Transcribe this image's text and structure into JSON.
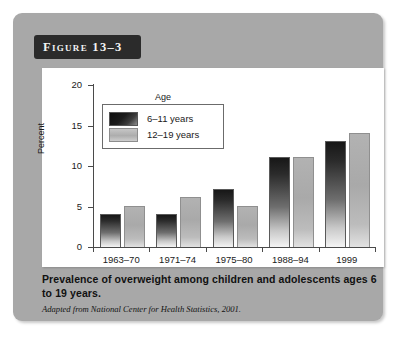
{
  "figure": {
    "banner_label": "Figure 13–3",
    "caption": "Prevalence of overweight among children and adolescents ages 6 to 19 years.",
    "source_note": "Adapted from National Center for Health Statistics, 2001."
  },
  "colors": {
    "panel_background": "#a8a8a8",
    "banner_background": "#2b2b2b",
    "banner_text": "#f2f2f2",
    "plot_background": "#ffffff",
    "series_6_11": "#1c1c1c",
    "series_12_19": "#adadad",
    "axis": "#4a4a4a"
  },
  "chart_data": {
    "type": "bar",
    "title": "",
    "xlabel": "",
    "ylabel": "Percent",
    "ylim": [
      0,
      20
    ],
    "yticks": [
      0,
      5,
      10,
      15,
      20
    ],
    "ytick_labels": [
      "0",
      "5",
      "10",
      "15",
      "20"
    ],
    "grid": false,
    "legend_title": "Age",
    "legend_position": "upper-left-inside",
    "categories": [
      "1963–70",
      "1971–74",
      "1975–80",
      "1988–94",
      "1999"
    ],
    "series": [
      {
        "name": "6–11 years",
        "values": [
          4,
          4,
          7,
          11,
          13
        ]
      },
      {
        "name": "12–19 years",
        "values": [
          5,
          6,
          5,
          11,
          14
        ]
      }
    ]
  }
}
